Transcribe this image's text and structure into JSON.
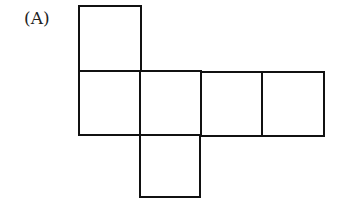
{
  "figure": {
    "label": "(A)",
    "stroke_color": "#111111",
    "squares": [
      {
        "name": "top",
        "x": 79,
        "y": 6,
        "w": 62,
        "h": 65
      },
      {
        "name": "row-1",
        "x": 79,
        "y": 71,
        "w": 61,
        "h": 64
      },
      {
        "name": "row-2",
        "x": 140,
        "y": 71,
        "w": 61,
        "h": 64
      },
      {
        "name": "row-3",
        "x": 201,
        "y": 72,
        "w": 61,
        "h": 64
      },
      {
        "name": "row-4",
        "x": 262,
        "y": 72,
        "w": 62,
        "h": 64
      },
      {
        "name": "bottom",
        "x": 140,
        "y": 135,
        "w": 60,
        "h": 62
      }
    ]
  }
}
